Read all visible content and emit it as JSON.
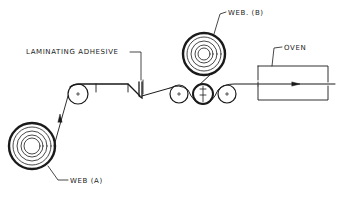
{
  "diagram": {
    "type": "laminating process schematic",
    "labels": {
      "web_a": "WEB (A)",
      "web_b": "WEB. (B)",
      "adhesive": "LAMINATING  ADHESIVE",
      "oven": "OVEN"
    },
    "colors": {
      "line": "#1a1a1a",
      "background": "#ffffff"
    },
    "components": [
      {
        "id": "web-a-roll",
        "label": "WEB (A)"
      },
      {
        "id": "web-b-roll",
        "label": "WEB. (B)"
      },
      {
        "id": "idler-roller-1"
      },
      {
        "id": "adhesive-applicator",
        "label": "LAMINATING ADHESIVE"
      },
      {
        "id": "nip-roller-left"
      },
      {
        "id": "nip-roller-center"
      },
      {
        "id": "nip-roller-right"
      },
      {
        "id": "oven",
        "label": "OVEN"
      }
    ]
  }
}
